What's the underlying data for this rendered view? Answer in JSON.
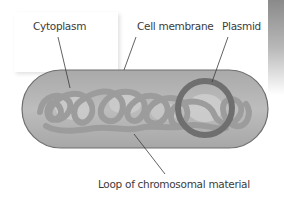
{
  "diagram": {
    "type": "bacterial-cell",
    "labels": {
      "cytoplasm": "Cytoplasm",
      "cell_membrane": "Cell membrane",
      "plasmid": "Plasmid",
      "chromosome": "Loop of chromosomal material"
    },
    "colors": {
      "cell_fill": "#b5b5b5",
      "cell_outline": "#6e6e6e",
      "chromosome": "#9c9c9c",
      "plasmid": "#6f6f6f",
      "text": "#3c3c3c",
      "leader_line": "#3a3a3a"
    }
  }
}
